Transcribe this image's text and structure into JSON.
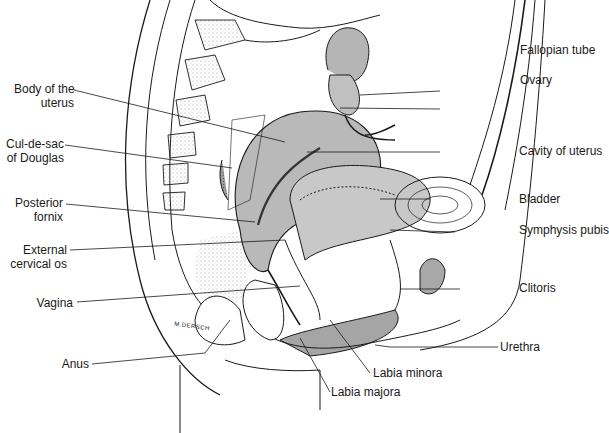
{
  "figure": {
    "signature": "M.DERSCH",
    "colors": {
      "line": "#1a1a1a",
      "organ_fill": "#b8b8b8",
      "stipple": "#9a9a9a",
      "background": "#ffffff"
    }
  },
  "labels": {
    "left": [
      {
        "id": "body-of-uterus",
        "line1": "Body of the",
        "line2": "uterus"
      },
      {
        "id": "cul-de-sac",
        "line1": "Cul-de-sac",
        "line2": "of Douglas"
      },
      {
        "id": "posterior-fornix",
        "line1": "Posterior",
        "line2": "fornix"
      },
      {
        "id": "external-cervical-os",
        "line1": "External",
        "line2": "cervical os"
      },
      {
        "id": "vagina",
        "line1": "Vagina"
      },
      {
        "id": "anus",
        "line1": "Anus"
      }
    ],
    "right": [
      {
        "id": "fallopian-tube",
        "line1": "Fallopian tube"
      },
      {
        "id": "ovary",
        "line1": "Ovary"
      },
      {
        "id": "cavity-of-uterus",
        "line1": "Cavity of uterus"
      },
      {
        "id": "bladder",
        "line1": "Bladder"
      },
      {
        "id": "symphysis-pubis",
        "line1": "Symphysis pubis"
      },
      {
        "id": "clitoris",
        "line1": "Clitoris"
      },
      {
        "id": "urethra",
        "line1": "Urethra"
      }
    ],
    "bottom": [
      {
        "id": "labia-minora",
        "line1": "Labia minora"
      },
      {
        "id": "labia-majora",
        "line1": "Labia majora"
      }
    ]
  }
}
